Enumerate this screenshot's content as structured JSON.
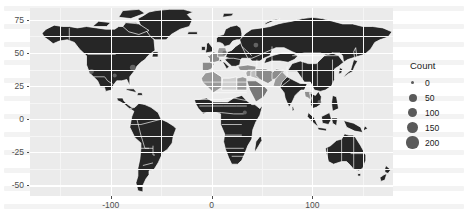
{
  "chart_data": {
    "type": "map",
    "title": "",
    "subtitle": "",
    "xlabel": "",
    "ylabel": "",
    "projection": "equirectangular",
    "xlim": [
      -180,
      180
    ],
    "ylim": [
      -58,
      84
    ],
    "grid": true,
    "panel_background": "#ebebeb",
    "gridline_color": "#ffffff",
    "land_fill_default": "#262626",
    "land_border": "#ffffff",
    "legend_position": "right",
    "x_ticks": [
      {
        "value": -100,
        "label": "-100"
      },
      {
        "value": 0,
        "label": "0"
      },
      {
        "value": 100,
        "label": "100"
      }
    ],
    "y_ticks": [
      {
        "value": 75,
        "label": "75"
      },
      {
        "value": 50,
        "label": "50"
      },
      {
        "value": 25,
        "label": "25"
      },
      {
        "value": 0,
        "label": "0"
      },
      {
        "value": -25,
        "label": "-25"
      },
      {
        "value": -50,
        "label": "-50"
      }
    ],
    "x_minor_ticks": [
      -150,
      -50,
      50,
      150
    ],
    "y_minor_ticks": [
      62.5,
      37.5,
      12.5,
      -12.5,
      -37.5
    ],
    "legend": {
      "title": "Count",
      "type": "size",
      "marker_color": "#5a5a5a",
      "breaks": [
        {
          "label": "0",
          "value": 0,
          "radius_px": 1.6
        },
        {
          "label": "50",
          "value": 50,
          "radius_px": 4.0
        },
        {
          "label": "100",
          "value": 100,
          "radius_px": 4.8
        },
        {
          "label": "150",
          "value": 150,
          "radius_px": 5.4
        },
        {
          "label": "200",
          "value": 200,
          "radius_px": 6.1
        }
      ]
    },
    "highlighted_regions": [
      {
        "name": "Iraq",
        "fill": "#bdbdbd"
      },
      {
        "name": "Syria",
        "fill": "#a8a8a8"
      },
      {
        "name": "Turkey",
        "fill": "#8f8f8f"
      },
      {
        "name": "Iran",
        "fill": "#8a8a8a"
      },
      {
        "name": "Saudi Arabia",
        "fill": "#777777"
      },
      {
        "name": "Egypt",
        "fill": "#9b9b9b"
      },
      {
        "name": "Libya",
        "fill": "#cfcfcf"
      },
      {
        "name": "Algeria",
        "fill": "#9a9a9a"
      },
      {
        "name": "France",
        "fill": "#8d8d8d"
      },
      {
        "name": "Spain",
        "fill": "#8a8a8a"
      },
      {
        "name": "Germany",
        "fill": "#9a9a9a"
      },
      {
        "name": "Afghanistan",
        "fill": "#8d8d8d"
      },
      {
        "name": "Pakistan",
        "fill": "#9a9a9a"
      },
      {
        "name": "Myanmar",
        "fill": "#8d8d8d"
      }
    ],
    "points": [
      {
        "name": "USA-west",
        "x": -119,
        "y": 36,
        "radius_px": 2.4
      },
      {
        "name": "USA-east",
        "x": -78,
        "y": 39,
        "radius_px": 2.9
      },
      {
        "name": "USA-central",
        "x": -96,
        "y": 33,
        "radius_px": 2.0
      },
      {
        "name": "Europe-central",
        "x": 13,
        "y": 50,
        "radius_px": 2.2
      },
      {
        "name": "Russia-west",
        "x": 44,
        "y": 56,
        "radius_px": 2.4
      },
      {
        "name": "Africa-east",
        "x": 33,
        "y": 5,
        "radius_px": 2.0
      },
      {
        "name": "Asia-southeast",
        "x": 107,
        "y": 13,
        "radius_px": 1.9
      }
    ]
  }
}
